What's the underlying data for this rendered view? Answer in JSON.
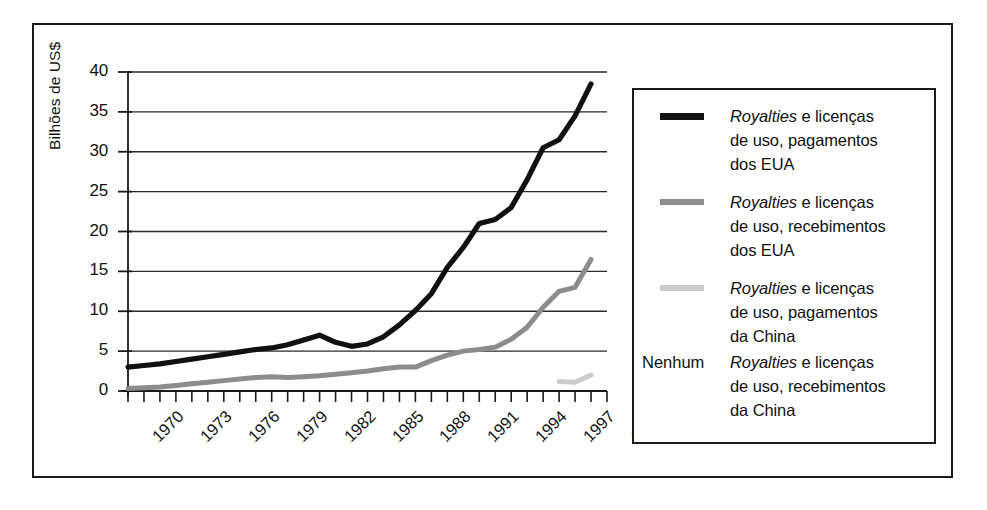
{
  "chart_data": {
    "type": "line",
    "title": "",
    "subtitle": "",
    "xlabel": "",
    "ylabel": "Bilhões de US$",
    "xlim": [
      1970,
      2000
    ],
    "ylim": [
      0,
      40
    ],
    "y_ticks": [
      "0",
      "5",
      "10",
      "15",
      "20",
      "25",
      "30",
      "35",
      "40"
    ],
    "x_ticks": [
      "1970",
      "1973",
      "1976",
      "1979",
      "1982",
      "1985",
      "1988",
      "1991",
      "1994",
      "1997",
      "2000"
    ],
    "x_minor_tick_every": 1,
    "grid": "horizontal",
    "legend_position": "right-outside",
    "series": [
      {
        "name": "Royalties e licenças de uso, pagamentos dos EUA",
        "color": "#111111",
        "style": "thick-solid",
        "x": [
          1970,
          1971,
          1972,
          1973,
          1974,
          1975,
          1976,
          1977,
          1978,
          1979,
          1980,
          1981,
          1982,
          1983,
          1984,
          1985,
          1986,
          1987,
          1988,
          1989,
          1990,
          1991,
          1992,
          1993,
          1994,
          1995,
          1996,
          1997,
          1998,
          1999
        ],
        "values": [
          3.0,
          3.2,
          3.4,
          3.7,
          4.0,
          4.3,
          4.6,
          4.9,
          5.2,
          5.4,
          5.8,
          6.4,
          7.0,
          6.1,
          5.6,
          5.9,
          6.8,
          8.3,
          10.1,
          12.2,
          15.5,
          18.0,
          21.0,
          21.5,
          23.0,
          26.5,
          30.5,
          31.5,
          34.5,
          38.5
        ]
      },
      {
        "name": "Royalties e licenças de uso, recebimentos dos EUA",
        "color": "#8c8c8c",
        "style": "medium-solid",
        "x": [
          1970,
          1971,
          1972,
          1973,
          1974,
          1975,
          1976,
          1977,
          1978,
          1979,
          1980,
          1981,
          1982,
          1983,
          1984,
          1985,
          1986,
          1987,
          1988,
          1989,
          1990,
          1991,
          1992,
          1993,
          1994,
          1995,
          1996,
          1997,
          1998,
          1999
        ],
        "values": [
          0.3,
          0.4,
          0.5,
          0.7,
          0.9,
          1.1,
          1.3,
          1.5,
          1.7,
          1.8,
          1.7,
          1.8,
          1.9,
          2.1,
          2.3,
          2.5,
          2.8,
          3.0,
          3.0,
          3.8,
          4.5,
          5.0,
          5.2,
          5.5,
          6.5,
          8.0,
          10.5,
          12.5,
          13.0,
          16.5
        ]
      },
      {
        "name": "Royalties e licenças de uso, pagamentos da China",
        "color": "#cccccc",
        "style": "medium-solid",
        "x": [
          1997,
          1998,
          1999
        ],
        "values": [
          1.2,
          1.1,
          2.0
        ]
      },
      {
        "name": "Royalties e licenças de uso, recebimentos da China",
        "color": "none",
        "style": "none",
        "x": [],
        "values": [],
        "note": "Nenhum"
      }
    ]
  },
  "axis": {
    "y_title": "Bilhões de US$",
    "y_ticks": [
      "40",
      "35",
      "30",
      "25",
      "20",
      "15",
      "10",
      "5",
      "0"
    ],
    "x_ticks": [
      "1970",
      "1973",
      "1976",
      "1979",
      "1982",
      "1985",
      "1988",
      "1991",
      "1994",
      "1997",
      "2000"
    ]
  },
  "legend": {
    "items": [
      {
        "swatch": "black",
        "none_label": "",
        "line1": "Royalties",
        "line1_rest": " e licenças",
        "line2": "de uso, pagamentos",
        "line3": "dos EUA"
      },
      {
        "swatch": "gray",
        "none_label": "",
        "line1": "Royalties",
        "line1_rest": " e licenças",
        "line2": "de uso, recebimentos",
        "line3": "dos EUA"
      },
      {
        "swatch": "light",
        "none_label": "",
        "line1": "Royalties",
        "line1_rest": " e licenças",
        "line2": "de uso, pagamentos",
        "line3": "da China"
      },
      {
        "swatch": "none",
        "none_label": "Nenhum",
        "line1": "Royalties",
        "line1_rest": " e licenças",
        "line2": "de uso, recebimentos",
        "line3": "da China"
      }
    ]
  }
}
